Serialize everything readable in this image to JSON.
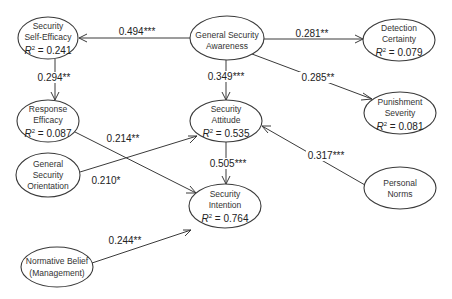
{
  "diagram": {
    "type": "structural-equation-path-model",
    "nodes": [
      {
        "id": "sse",
        "lines": [
          "Security",
          "Self-Efficacy"
        ],
        "r2": "0.241",
        "cx": 48,
        "cy": 38,
        "rx": 30,
        "ry": 21
      },
      {
        "id": "gsa",
        "lines": [
          "General Security",
          "Awareness"
        ],
        "r2": null,
        "cx": 227,
        "cy": 38,
        "rx": 37,
        "ry": 22
      },
      {
        "id": "dc",
        "lines": [
          "Detection",
          "Certainty"
        ],
        "r2": "0.079",
        "cx": 399,
        "cy": 40,
        "rx": 36,
        "ry": 21
      },
      {
        "id": "re",
        "lines": [
          "Response",
          "Efficacy"
        ],
        "r2": "0.087",
        "cx": 48,
        "cy": 121,
        "rx": 31,
        "ry": 21
      },
      {
        "id": "ps",
        "lines": [
          "Punishment",
          "Severity"
        ],
        "r2": "0.081",
        "cx": 400,
        "cy": 113,
        "rx": 36,
        "ry": 21
      },
      {
        "id": "sa",
        "lines": [
          "Security",
          "Attitude"
        ],
        "r2": "0.535",
        "cx": 226,
        "cy": 121,
        "rx": 36,
        "ry": 21
      },
      {
        "id": "gso",
        "lines": [
          "General",
          "Security",
          "Orientation"
        ],
        "r2": null,
        "cx": 48,
        "cy": 175,
        "rx": 32,
        "ry": 22
      },
      {
        "id": "pn",
        "lines": [
          "Personal",
          "Norms"
        ],
        "r2": null,
        "cx": 400,
        "cy": 188,
        "rx": 36,
        "ry": 21
      },
      {
        "id": "si",
        "lines": [
          "Security",
          "Intention"
        ],
        "r2": "0.764",
        "cx": 225,
        "cy": 206,
        "rx": 36,
        "ry": 22
      },
      {
        "id": "nb",
        "lines": [
          "Normative Belief",
          "(Management)"
        ],
        "r2": null,
        "cx": 57,
        "cy": 267,
        "rx": 36,
        "ry": 20
      }
    ],
    "edges": [
      {
        "from": "gsa",
        "to": "sse",
        "coef": "0.494***"
      },
      {
        "from": "gsa",
        "to": "dc",
        "coef": "0.281**"
      },
      {
        "from": "gsa",
        "to": "ps",
        "coef": "0.285**"
      },
      {
        "from": "gsa",
        "to": "sa",
        "coef": "0.349***"
      },
      {
        "from": "sse",
        "to": "re",
        "coef": "0.294**"
      },
      {
        "from": "re",
        "to": "si",
        "coef": "0.214**"
      },
      {
        "from": "gso",
        "to": "sa",
        "coef": "0.210*"
      },
      {
        "from": "pn",
        "to": "sa",
        "coef": "0.317***"
      },
      {
        "from": "sa",
        "to": "si",
        "coef": "0.505***"
      },
      {
        "from": "nb",
        "to": "si",
        "coef": "0.244**"
      }
    ],
    "r2_prefix": "R",
    "r2_sup": "2",
    "r2_eq": " = "
  }
}
